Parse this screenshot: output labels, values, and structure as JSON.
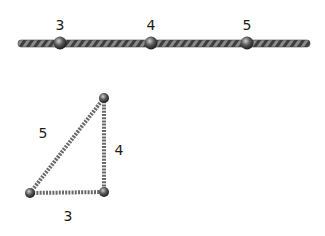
{
  "rope": {
    "knot_labels": [
      "3",
      "4",
      "5"
    ],
    "rope_color": "#5a5a5a",
    "knot_color": "#3a3a3a"
  },
  "triangle": {
    "hypotenuse_label": "5",
    "vertical_side_label": "4",
    "base_label": "3"
  }
}
